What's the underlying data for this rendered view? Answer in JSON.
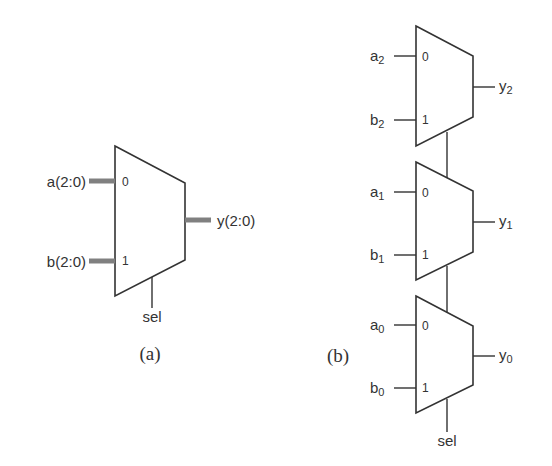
{
  "colors": {
    "stroke": "#333333",
    "bus": "#808080",
    "text": "#333333",
    "background": "#ffffff"
  },
  "diagram_a": {
    "caption": "(a)",
    "inputs": [
      {
        "label": "a(2:0)",
        "port": "0"
      },
      {
        "label": "b(2:0)",
        "port": "1"
      }
    ],
    "output": {
      "label": "y(2:0)"
    },
    "select": {
      "label": "sel"
    }
  },
  "diagram_b": {
    "caption": "(b)",
    "muxes": [
      {
        "a": "a",
        "a_sub": "2",
        "b": "b",
        "b_sub": "2",
        "y": "y",
        "y_sub": "2",
        "port0": "0",
        "port1": "1"
      },
      {
        "a": "a",
        "a_sub": "1",
        "b": "b",
        "b_sub": "1",
        "y": "y",
        "y_sub": "1",
        "port0": "0",
        "port1": "1"
      },
      {
        "a": "a",
        "a_sub": "0",
        "b": "b",
        "b_sub": "0",
        "y": "y",
        "y_sub": "0",
        "port0": "0",
        "port1": "1"
      }
    ],
    "select": {
      "label": "sel"
    }
  }
}
